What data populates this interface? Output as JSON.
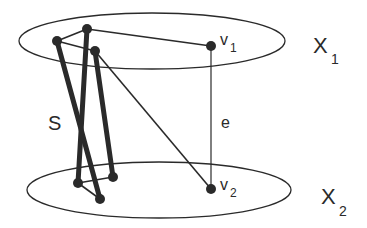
{
  "diagram": {
    "colors": {
      "stroke": "#2a2a2a",
      "background": "#ffffff"
    },
    "sets": [
      {
        "id": "X1",
        "label": "X",
        "subscript": "1"
      },
      {
        "id": "X2",
        "label": "X",
        "subscript": "2"
      }
    ],
    "vertices": [
      {
        "id": "v1",
        "label": "v",
        "subscript": "1",
        "set": "X1"
      },
      {
        "id": "v2",
        "label": "v",
        "subscript": "2",
        "set": "X2"
      }
    ],
    "edge": {
      "id": "e",
      "label": "e",
      "from": "v1",
      "to": "v2"
    },
    "subgraph": {
      "id": "S",
      "label": "S"
    }
  }
}
